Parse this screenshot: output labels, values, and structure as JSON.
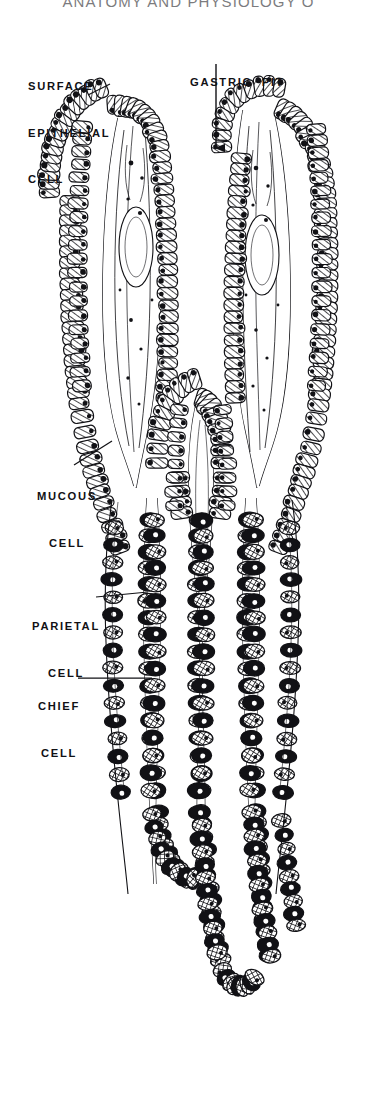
{
  "page": {
    "running_head": "ANATOMY AND PHYSIOLOGY O",
    "background_color": "#ffffff",
    "ink_color": "#111115"
  },
  "figure": {
    "name": "gastric-mucosa-diagram",
    "style": "black-and-white engraved line drawing, hatched and cross-hatched cells with solid black nuclei"
  },
  "labels": [
    {
      "id": "surface-epithelial-cell",
      "lines": [
        "SURFACE",
        "EPITHELIAL",
        "CELL"
      ],
      "text": "SURFACE EPITHELIAL CELL",
      "x": 28,
      "y": 48,
      "align": "left",
      "leader": {
        "x1": 88,
        "y1": 95,
        "x2": 110,
        "y2": 84
      }
    },
    {
      "id": "gastric-pit",
      "lines": [
        "GASTRIC  PIT"
      ],
      "text": "GASTRIC  PIT",
      "x": 190,
      "y": 44,
      "align": "left",
      "leader": {
        "x1": 216,
        "y1": 64,
        "x2": 216,
        "y2": 148
      },
      "arrow": true
    },
    {
      "id": "mucous-cell",
      "lines": [
        "MUCOUS",
        "CELL"
      ],
      "text": "MUCOUS CELL",
      "x": 24,
      "y": 466,
      "align": "left",
      "leader": {
        "x1": 74,
        "y1": 465,
        "x2": 112,
        "y2": 441
      }
    },
    {
      "id": "parietal-cell",
      "lines": [
        "PARIETAL",
        "CELL"
      ],
      "text": "PARIETAL CELL",
      "x": 24,
      "y": 588,
      "align": "left",
      "leader": {
        "x1": 96,
        "y1": 597,
        "x2": 148,
        "y2": 592
      }
    },
    {
      "id": "chief-cell",
      "lines": [
        "CHIEF",
        "CELL"
      ],
      "text": "CHIEF CELL",
      "x": 24,
      "y": 668,
      "align": "left",
      "leader": {
        "x1": 78,
        "y1": 678,
        "x2": 152,
        "y2": 678
      }
    }
  ],
  "chart_data": {
    "type": "diagram",
    "annotations": [
      "SURFACE EPITHELIAL CELL",
      "GASTRIC  PIT",
      "MUCOUS CELL",
      "PARIETAL CELL",
      "CHIEF CELL"
    ],
    "regions": [
      {
        "name": "surface epithelium",
        "y_range": [
          85,
          180
        ],
        "cell_fill": "diagonal-hatch",
        "nuclei": "solid-black"
      },
      {
        "name": "gastric pit (foveola)",
        "y_range": [
          90,
          430
        ],
        "cell_fill": "diagonal-hatch"
      },
      {
        "name": "neck / mucous cells",
        "y_range": [
          380,
          520
        ],
        "cell_fill": "diagonal-hatch"
      },
      {
        "name": "gland body — parietal cells",
        "y_range": [
          500,
          840
        ],
        "cell_fill": "solid-black"
      },
      {
        "name": "gland body — chief cells",
        "y_range": [
          620,
          1010
        ],
        "cell_fill": "cross-hatch"
      },
      {
        "name": "gland base / fundus",
        "y_range": [
          830,
          1010
        ],
        "cell_fill": "cross-hatch"
      }
    ]
  }
}
